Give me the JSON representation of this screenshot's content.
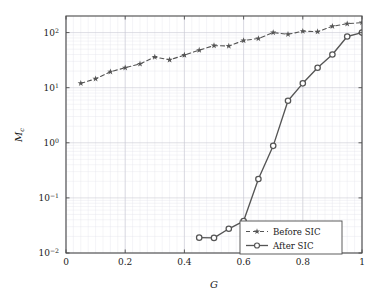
{
  "chart_data": {
    "type": "line",
    "title": "",
    "xlabel": "G",
    "ylabel": "M_c",
    "ylabel_base": "M",
    "ylabel_sub": "c",
    "xscale": "linear",
    "yscale": "log",
    "xlim": [
      0,
      1
    ],
    "ylim": [
      0.01,
      200
    ],
    "grid": true,
    "grid_minor": true,
    "legend_position": "lower right",
    "xticks": [
      0,
      0.2,
      0.4,
      0.6,
      0.8,
      1
    ],
    "xtick_labels": [
      "0",
      "0.2",
      "0.4",
      "0.6",
      "0.8",
      "1"
    ],
    "yticks": [
      0.01,
      0.1,
      1,
      10,
      100
    ],
    "ytick_labels": [
      "10−2",
      "10−1",
      "10⁰",
      "10¹",
      "10²"
    ],
    "ytick_mantissa": [
      "10",
      "10",
      "10",
      "10",
      "10"
    ],
    "ytick_exponents": [
      "−2",
      "−1",
      "0",
      "1",
      "2"
    ],
    "series": [
      {
        "name": "Before SIC",
        "legend_label": "Before SIC",
        "marker": "star",
        "linestyle": "dashed",
        "color": "#555555",
        "x": [
          0.05,
          0.1,
          0.15,
          0.2,
          0.25,
          0.3,
          0.35,
          0.4,
          0.45,
          0.5,
          0.55,
          0.6,
          0.65,
          0.7,
          0.75,
          0.8,
          0.85,
          0.9,
          0.95,
          1.0
        ],
        "y": [
          12.0,
          14.5,
          19.5,
          23.0,
          27.0,
          36.0,
          32.0,
          39.0,
          48.0,
          58.0,
          57.0,
          72.0,
          78.0,
          100.0,
          93.0,
          106.0,
          104.0,
          130.0,
          145.0,
          152.0
        ]
      },
      {
        "name": "After SIC",
        "legend_label": "After SIC",
        "marker": "circle",
        "linestyle": "solid",
        "color": "#555555",
        "x": [
          0.45,
          0.5,
          0.55,
          0.6,
          0.65,
          0.7,
          0.75,
          0.8,
          0.85,
          0.9,
          0.95,
          1.0
        ],
        "y": [
          0.019,
          0.0188,
          0.0275,
          0.038,
          0.22,
          0.88,
          5.8,
          12.0,
          23.0,
          40.0,
          85.0,
          100.0
        ]
      }
    ]
  },
  "legend": {
    "entries": [
      {
        "label": "Before SIC"
      },
      {
        "label": "After SIC"
      }
    ]
  },
  "axes": {
    "x_label": "G",
    "y_label_base": "M",
    "y_label_sub": "c"
  }
}
